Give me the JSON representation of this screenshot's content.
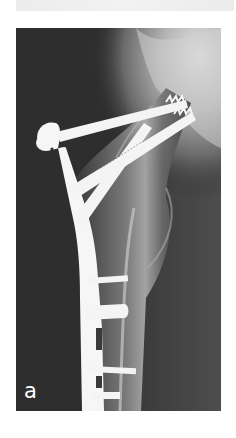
{
  "figure": {
    "type": "radiograph",
    "panel_label": "a",
    "colors": {
      "background": "#2b2b2b",
      "bone": "#8a8a8a",
      "implant": "#f6f6f6",
      "label": "#ffffff"
    }
  }
}
